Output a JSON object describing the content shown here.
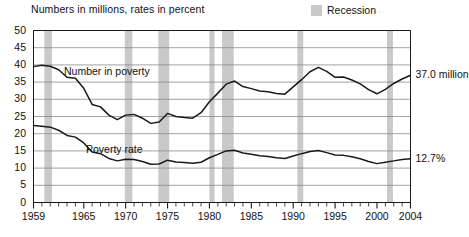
{
  "chart_data": {
    "type": "line",
    "title": "Numbers in millions, rates in percent",
    "xlabel": "",
    "ylabel": "",
    "grid": true,
    "legend_position": "top-right",
    "xlim": [
      1959,
      2004
    ],
    "ylim": [
      0,
      50
    ],
    "ytick_step": 5,
    "yticks": [
      "0",
      "5",
      "10",
      "15",
      "20",
      "25",
      "30",
      "35",
      "40",
      "45",
      "50"
    ],
    "xticks": [
      "1959",
      "1965",
      "1970",
      "1975",
      "1980",
      "1985",
      "1990",
      "1995",
      "2000",
      "2004"
    ],
    "x": [
      1959,
      1960,
      1961,
      1962,
      1963,
      1964,
      1965,
      1966,
      1967,
      1968,
      1969,
      1970,
      1971,
      1972,
      1973,
      1974,
      1975,
      1976,
      1977,
      1978,
      1979,
      1980,
      1981,
      1982,
      1983,
      1984,
      1985,
      1986,
      1987,
      1988,
      1989,
      1990,
      1991,
      1992,
      1993,
      1994,
      1995,
      1996,
      1997,
      1998,
      1999,
      2000,
      2001,
      2002,
      2003,
      2004
    ],
    "series": [
      {
        "name": "Number in poverty",
        "unit": "millions",
        "label_text": "Number in poverty",
        "end_annotation": "37.0 million",
        "values": [
          39.5,
          39.9,
          39.6,
          38.6,
          36.4,
          36.1,
          33.2,
          28.5,
          27.8,
          25.4,
          24.1,
          25.4,
          25.6,
          24.5,
          23.0,
          23.4,
          25.9,
          25.0,
          24.7,
          24.5,
          26.1,
          29.3,
          31.8,
          34.4,
          35.3,
          33.7,
          33.1,
          32.4,
          32.2,
          31.7,
          31.5,
          33.6,
          35.7,
          38.0,
          39.3,
          38.1,
          36.4,
          36.5,
          35.6,
          34.5,
          32.8,
          31.6,
          32.9,
          34.6,
          35.9,
          37.0
        ]
      },
      {
        "name": "Poverty rate",
        "unit": "percent",
        "label_text": "Poverty rate",
        "end_annotation": "12.7%",
        "values": [
          22.4,
          22.2,
          21.9,
          21.0,
          19.5,
          19.0,
          17.3,
          14.7,
          14.2,
          12.8,
          12.1,
          12.6,
          12.5,
          11.9,
          11.1,
          11.2,
          12.3,
          11.8,
          11.6,
          11.4,
          11.7,
          13.0,
          14.0,
          15.0,
          15.2,
          14.4,
          14.0,
          13.6,
          13.4,
          13.0,
          12.8,
          13.5,
          14.2,
          14.8,
          15.1,
          14.5,
          13.8,
          13.7,
          13.3,
          12.7,
          11.9,
          11.3,
          11.7,
          12.1,
          12.5,
          12.7
        ]
      }
    ],
    "shaded_regions": {
      "label": "Recession",
      "color": "#c9c9c9",
      "spans": [
        [
          1960.3,
          1961.2
        ],
        [
          1969.9,
          1970.8
        ],
        [
          1973.9,
          1975.2
        ],
        [
          1980.0,
          1980.6
        ],
        [
          1981.5,
          1982.9
        ],
        [
          1990.5,
          1991.2
        ],
        [
          2001.2,
          2001.9
        ]
      ]
    },
    "annotations": [
      {
        "text": "37.0 million",
        "value": 37.0,
        "series": "Number in poverty"
      },
      {
        "text": "12.7%",
        "value": 12.7,
        "series": "Poverty rate"
      }
    ]
  },
  "colors": {
    "line": "#1a1a1a",
    "grid": "#8a8a8a",
    "axis": "#1a1a1a",
    "recession": "#c9c9c9",
    "background": "#ffffff"
  }
}
